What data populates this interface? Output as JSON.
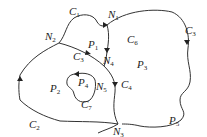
{
  "diagram": {
    "type": "planar-graph",
    "stroke_color": "#333333",
    "background": "#ffffff",
    "nodes": [
      {
        "id": "N1",
        "letter": "N",
        "sub": "1",
        "x": 107,
        "y": 20
      },
      {
        "id": "N2",
        "letter": "N",
        "sub": "2",
        "x": 46,
        "y": 37
      },
      {
        "id": "N3",
        "letter": "N",
        "sub": "3",
        "x": 117,
        "y": 123
      },
      {
        "id": "N4",
        "letter": "N",
        "sub": "4",
        "x": 104,
        "y": 64
      },
      {
        "id": "N5",
        "letter": "N",
        "sub": "5",
        "x": 111,
        "y": 87
      }
    ],
    "curves": [
      {
        "id": "C1",
        "letter": "C",
        "sub": "1",
        "x": 62,
        "y": 17
      },
      {
        "id": "C2",
        "letter": "C",
        "sub": "2",
        "x": 29,
        "y": 130
      },
      {
        "id": "C3",
        "letter": "C",
        "sub": "3",
        "x": 72,
        "y": 61
      },
      {
        "id": "C4",
        "letter": "C",
        "sub": "4",
        "x": 124,
        "y": 89
      },
      {
        "id": "C5",
        "letter": "C",
        "sub": "3",
        "x": 179,
        "y": 33
      },
      {
        "id": "C6",
        "letter": "C",
        "sub": "6",
        "x": 126,
        "y": 47
      },
      {
        "id": "C7",
        "letter": "C",
        "sub": "7",
        "x": 84,
        "y": 110
      }
    ],
    "regions": [
      {
        "id": "P1",
        "letter": "P",
        "sub": "1",
        "x": 91,
        "y": 48
      },
      {
        "id": "P2",
        "letter": "P",
        "sub": "2",
        "x": 48,
        "y": 93
      },
      {
        "id": "P3",
        "letter": "P",
        "sub": "3",
        "x": 143,
        "y": 73
      },
      {
        "id": "P4",
        "letter": "P",
        "sub": "4",
        "x": 80,
        "y": 85
      },
      {
        "id": "P5",
        "letter": "P",
        "sub": "5",
        "x": 172,
        "y": 124
      }
    ]
  }
}
